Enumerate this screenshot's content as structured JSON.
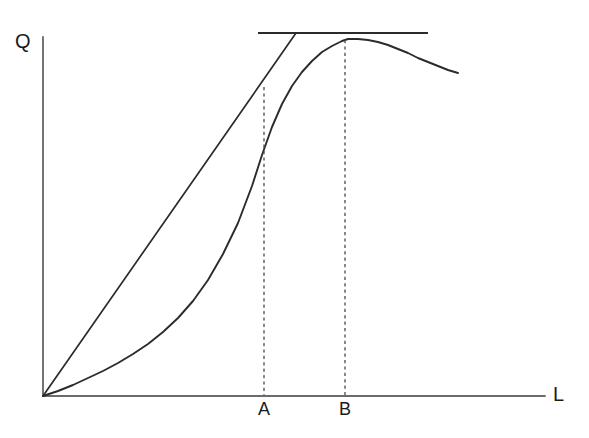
{
  "figure": {
    "background_color": "#ffffff",
    "line_color": "#2b2b2b",
    "dash_color": "#4a4a4a",
    "axis_color": "#3a3a3a"
  },
  "axes": {
    "y_label": "Q",
    "x_label": "L",
    "origin_px": [
      43,
      396
    ],
    "y_axis_top_px": 37,
    "x_axis_right_px": 545
  },
  "ticks": {
    "x": [
      {
        "label": "A",
        "x_px": 264
      },
      {
        "label": "B",
        "x_px": 345
      }
    ]
  },
  "chart_data": {
    "type": "line",
    "title": "",
    "xlabel": "L",
    "ylabel": "Q",
    "xlim": [
      0,
      1
    ],
    "ylim": [
      0,
      1
    ],
    "grid": false,
    "legend": null,
    "annotations": [
      {
        "name": "point-A",
        "label": "A",
        "description": "labour input where the ray from the origin is tangent to the total product curve (average product maximum)",
        "x_px": 264
      },
      {
        "name": "point-B",
        "label": "B",
        "description": "labour input where the total product curve reaches its maximum (marginal product zero)",
        "x_px": 345
      }
    ],
    "series": [
      {
        "name": "total-product-curve",
        "style": "solid",
        "points_px": [
          [
            43,
            396
          ],
          [
            58,
            391
          ],
          [
            73,
            385
          ],
          [
            88,
            378
          ],
          [
            103,
            371
          ],
          [
            118,
            363
          ],
          [
            133,
            354
          ],
          [
            148,
            344
          ],
          [
            163,
            332
          ],
          [
            178,
            318
          ],
          [
            193,
            301
          ],
          [
            208,
            280
          ],
          [
            223,
            254
          ],
          [
            238,
            223
          ],
          [
            252,
            186
          ],
          [
            262,
            155
          ],
          [
            272,
            127
          ],
          [
            282,
            104
          ],
          [
            292,
            86
          ],
          [
            302,
            72
          ],
          [
            312,
            61
          ],
          [
            322,
            52
          ],
          [
            332,
            46
          ],
          [
            342,
            41
          ],
          [
            348,
            39
          ],
          [
            358,
            39
          ],
          [
            368,
            40
          ],
          [
            378,
            42
          ],
          [
            388,
            45
          ],
          [
            398,
            49
          ],
          [
            408,
            53
          ],
          [
            418,
            58
          ],
          [
            428,
            62
          ],
          [
            438,
            66
          ],
          [
            448,
            70
          ],
          [
            458,
            73
          ]
        ]
      },
      {
        "name": "ray-from-origin",
        "style": "solid",
        "description": "ray from the origin tangent to the total product curve at A",
        "points_px": [
          [
            43,
            396
          ],
          [
            296,
            33
          ]
        ]
      },
      {
        "name": "horizontal-tangent-line",
        "style": "solid",
        "description": "horizontal tangent to the total product curve at its maximum B",
        "points_px": [
          [
            258,
            33
          ],
          [
            428,
            33
          ]
        ]
      },
      {
        "name": "dashed-drop-line-a",
        "style": "dashed",
        "points_px": [
          [
            264,
            87
          ],
          [
            264,
            395
          ]
        ]
      },
      {
        "name": "dashed-drop-line-b",
        "style": "dashed",
        "points_px": [
          [
            345,
            40
          ],
          [
            345,
            395
          ]
        ]
      }
    ]
  }
}
